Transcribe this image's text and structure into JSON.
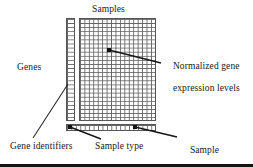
{
  "figure": {
    "title_top": "Samples",
    "labels": {
      "genes": "Genes",
      "samples": "Samples",
      "normalized_line1": "Normalized gene",
      "normalized_line2": "expression levels",
      "gene_identifiers": "Gene identifiers",
      "sample_type": "Sample type",
      "sample_class_line1": "Sample",
      "sample_class_line2": "class labels"
    },
    "colors": {
      "background": "#ffffff",
      "grid_line": "#666666",
      "grid_border": "#555555",
      "marker": "#111111",
      "text": "#171717",
      "rule": "#141414"
    },
    "matrix": {
      "columns": 17,
      "rows": 25,
      "gene_identifier_columns": 1,
      "class_bar_rows": 1
    }
  }
}
